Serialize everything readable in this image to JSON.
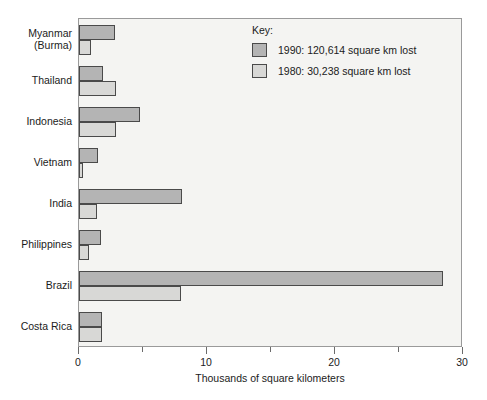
{
  "chart_data": {
    "type": "bar",
    "orientation": "horizontal",
    "title": "",
    "xlabel": "Thousands of square kilometers",
    "ylabel": "",
    "xlim": [
      0,
      30
    ],
    "xticks": [
      0,
      5,
      10,
      15,
      20,
      25,
      30
    ],
    "xtick_labels": [
      "0",
      "",
      "10",
      "",
      "20",
      "",
      "30"
    ],
    "grid": false,
    "legend_position": "top-right",
    "categories": [
      "Myanmar\n(Burma)",
      "Thailand",
      "Indonesia",
      "Vietnam",
      "India",
      "Philippines",
      "Brazil",
      "Costa Rica"
    ],
    "category_labels": [
      [
        "Myanmar",
        "(Burma)"
      ],
      [
        "Thailand"
      ],
      [
        "Indonesia"
      ],
      [
        "Vietnam"
      ],
      [
        "India"
      ],
      [
        "Philippines"
      ],
      [
        "Brazil"
      ],
      [
        "Costa Rica"
      ]
    ],
    "series": [
      {
        "name": "1990: 120,614 square km lost",
        "short_name": "1990",
        "color": "#b4b4b4",
        "values": [
          2.85,
          1.9,
          4.8,
          1.45,
          8.05,
          1.75,
          28.4,
          1.8
        ]
      },
      {
        "name": "1980: 30,238 square km lost",
        "short_name": "1980",
        "color": "#d8d8d6",
        "values": [
          0.9,
          2.9,
          2.9,
          0.3,
          1.4,
          0.8,
          8.0,
          1.8
        ]
      }
    ]
  },
  "legend": {
    "title": "Key:",
    "entries": [
      {
        "label": "1990: 120,614 square km lost",
        "swatch": "s1990"
      },
      {
        "label": "1980: 30,238 square km lost",
        "swatch": "s1980"
      }
    ]
  },
  "axis": {
    "x_title": "Thousands of square kilometers",
    "tick_labels": [
      "0",
      "10",
      "20",
      "30"
    ]
  }
}
